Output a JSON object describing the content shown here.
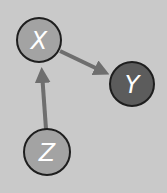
{
  "diagram": {
    "background": "#c9c9c9",
    "edge_color": "#6e6e6e",
    "nodes": [
      {
        "id": "X",
        "label": "X",
        "fill": "#a3a3a3",
        "cx": 39,
        "cy": 40,
        "r": 22
      },
      {
        "id": "Y",
        "label": "Y",
        "fill": "#5c5c5c",
        "cx": 132,
        "cy": 84,
        "r": 22
      },
      {
        "id": "Z",
        "label": "Z",
        "fill": "#a3a3a3",
        "cx": 47,
        "cy": 152,
        "r": 23
      }
    ],
    "edges": [
      {
        "from": "X",
        "to": "Y"
      },
      {
        "from": "Z",
        "to": "X"
      }
    ]
  }
}
